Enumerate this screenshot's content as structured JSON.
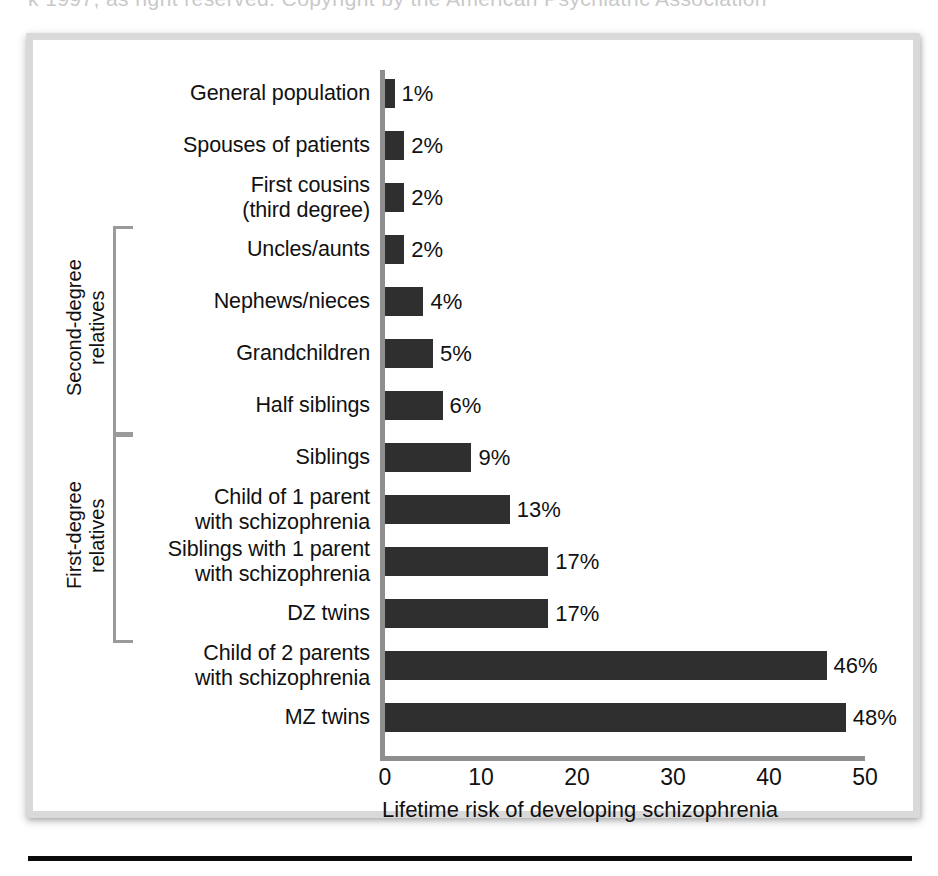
{
  "figure": {
    "ghost_text": "k 1997, as right reserved. Copyright by the American Psychiatric Association",
    "bar_color": "#2f2f2f",
    "axis_color": "#8e8e8e",
    "frame_color": "#d9d9d9"
  },
  "chart_data": {
    "type": "bar",
    "orientation": "horizontal",
    "title": "",
    "xlabel": "Lifetime risk of developing schizophrenia",
    "ylabel": "",
    "xlim": [
      0,
      50
    ],
    "xticks": [
      "0",
      "10",
      "20",
      "30",
      "40",
      "50"
    ],
    "xtick_values": [
      0,
      10,
      20,
      30,
      40,
      50
    ],
    "grid": false,
    "legend": false,
    "value_suffix": "%",
    "categories": [
      "General population",
      "Spouses of patients",
      "First cousins\n(third degree)",
      "Uncles/aunts",
      "Nephews/nieces",
      "Grandchildren",
      "Half siblings",
      "Siblings",
      "Child of 1 parent\nwith schizophrenia",
      "Siblings with 1 parent\nwith schizophrenia",
      "DZ twins",
      "Child of 2 parents\nwith schizophrenia",
      "MZ twins"
    ],
    "values": [
      1,
      2,
      2,
      2,
      4,
      5,
      6,
      9,
      13,
      17,
      17,
      46,
      48
    ],
    "value_labels": [
      "1%",
      "2%",
      "2%",
      "2%",
      "4%",
      "5%",
      "6%",
      "9%",
      "13%",
      "17%",
      "17%",
      "46%",
      "48%"
    ],
    "groups": [
      {
        "label": "Second-degree relatives",
        "label_line1": "Second-degree",
        "label_line2": "relatives",
        "first_index": 3,
        "last_index": 6
      },
      {
        "label": "First-degree relatives",
        "label_line1": "First-degree",
        "label_line2": "relatives",
        "first_index": 7,
        "last_index": 10
      }
    ]
  },
  "rows": [
    {
      "label_line1": "General population",
      "label_line2": "",
      "value_label": "1%"
    },
    {
      "label_line1": "Spouses of patients",
      "label_line2": "",
      "value_label": "2%"
    },
    {
      "label_line1": "First cousins",
      "label_line2": "(third degree)",
      "value_label": "2%"
    },
    {
      "label_line1": "Uncles/aunts",
      "label_line2": "",
      "value_label": "2%"
    },
    {
      "label_line1": "Nephews/nieces",
      "label_line2": "",
      "value_label": "4%"
    },
    {
      "label_line1": "Grandchildren",
      "label_line2": "",
      "value_label": "5%"
    },
    {
      "label_line1": "Half siblings",
      "label_line2": "",
      "value_label": "6%"
    },
    {
      "label_line1": "Siblings",
      "label_line2": "",
      "value_label": "9%"
    },
    {
      "label_line1": "Child of 1 parent",
      "label_line2": "with schizophrenia",
      "value_label": "13%"
    },
    {
      "label_line1": "Siblings with 1 parent",
      "label_line2": "with schizophrenia",
      "value_label": "17%"
    },
    {
      "label_line1": "DZ twins",
      "label_line2": "",
      "value_label": "17%"
    },
    {
      "label_line1": "Child of 2 parents",
      "label_line2": "with schizophrenia",
      "value_label": "46%"
    },
    {
      "label_line1": "MZ twins",
      "label_line2": "",
      "value_label": "48%"
    }
  ],
  "axis": {
    "ticks": [
      "0",
      "10",
      "20",
      "30",
      "40",
      "50"
    ],
    "title": "Lifetime risk of developing schizophrenia"
  },
  "groups": [
    {
      "line1": "Second-degree",
      "line2": "relatives"
    },
    {
      "line1": "First-degree",
      "line2": "relatives"
    }
  ]
}
